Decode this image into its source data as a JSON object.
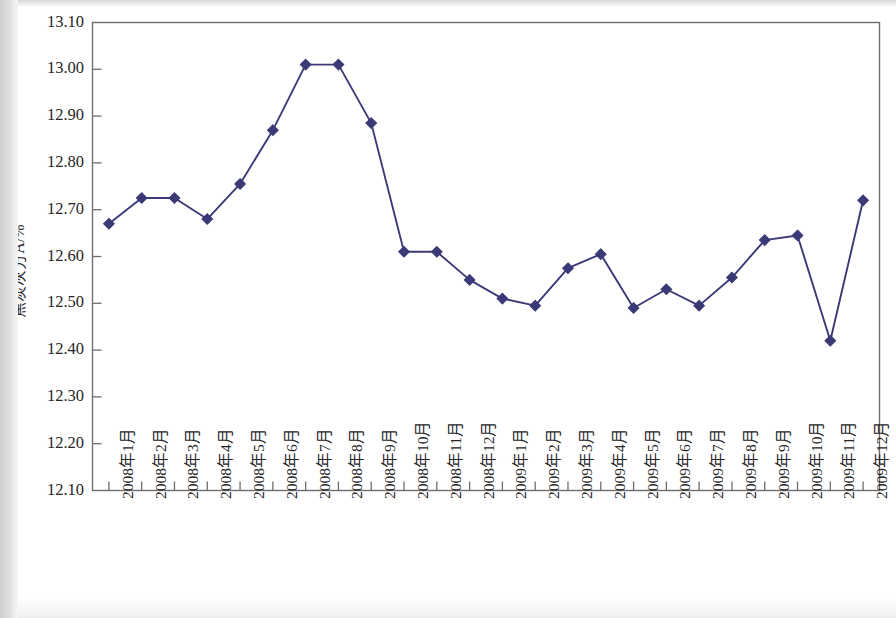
{
  "chart_data": {
    "type": "line",
    "title": "",
    "xlabel": "",
    "ylabel": "焦炭灰分A/%",
    "ylim": [
      12.1,
      13.1
    ],
    "ytick_step": 0.1,
    "grid": false,
    "legend": null,
    "marker": "diamond",
    "series_color": "#3b3a77",
    "categories": [
      "2008年1月",
      "2008年2月",
      "2008年3月",
      "2008年4月",
      "2008年5月",
      "2008年6月",
      "2008年7月",
      "2008年8月",
      "2008年9月",
      "2008年10月",
      "2008年11月",
      "2008年12月",
      "2009年1月",
      "2009年2月",
      "2009年3月",
      "2009年4月",
      "2009年5月",
      "2009年6月",
      "2009年7月",
      "2009年8月",
      "2009年9月",
      "2009年10月",
      "2009年11月",
      "2009年12月"
    ],
    "values": [
      12.67,
      12.725,
      12.725,
      12.68,
      12.755,
      12.87,
      13.01,
      13.01,
      12.885,
      12.61,
      12.61,
      12.55,
      12.51,
      12.495,
      12.575,
      12.605,
      12.49,
      12.53,
      12.495,
      12.555,
      12.635,
      12.645,
      12.42,
      12.72
    ],
    "ytick_labels": [
      "13.10",
      "13.00",
      "12.90",
      "12.80",
      "12.70",
      "12.60",
      "12.50",
      "12.40",
      "12.30",
      "12.20",
      "12.10"
    ],
    "ytick_values": [
      13.1,
      13.0,
      12.9,
      12.8,
      12.7,
      12.6,
      12.5,
      12.4,
      12.3,
      12.2,
      12.1
    ]
  },
  "style": {
    "axis_color": "#6e6e6e",
    "background": "#ffffff",
    "text_color": "#262626"
  }
}
